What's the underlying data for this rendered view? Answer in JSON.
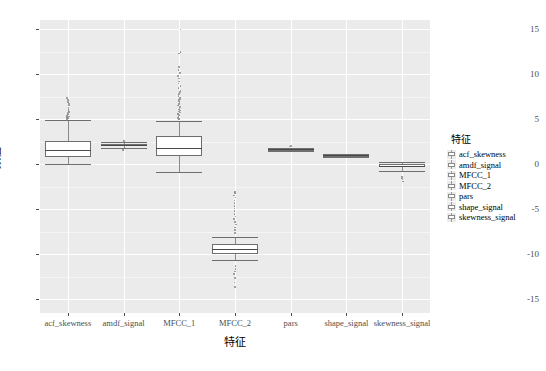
{
  "chart_data": {
    "type": "box",
    "title": "",
    "xlabel": "特征",
    "ylabel": "数值",
    "ylim": [
      -16.5,
      16.0
    ],
    "yticks": [
      15,
      10,
      5,
      0,
      -5,
      -10,
      -15
    ],
    "ytick_labels": [
      "15",
      "10",
      "5",
      "0",
      "-5",
      "-10",
      "-15"
    ],
    "grid": true,
    "legend_position": "right",
    "legend_title": "特征",
    "categories": [
      "acf_skewness",
      "amdf_signal",
      "MFCC_1",
      "MFCC_2",
      "pars",
      "shape_signal",
      "skewness_signal"
    ],
    "boxes": [
      {
        "name": "acf_skewness",
        "min": 0.05,
        "q1": 0.85,
        "median": 1.55,
        "q3": 2.55,
        "max": 4.95,
        "outliers": [
          5.05,
          5.1,
          5.15,
          5.2,
          5.25,
          5.3,
          5.35,
          5.45,
          5.5,
          5.6,
          5.7,
          5.8,
          5.9,
          6.0,
          6.1,
          6.3,
          6.5,
          6.7,
          6.9,
          7.1,
          7.35
        ]
      },
      {
        "name": "amdf_signal",
        "min": 1.75,
        "q1": 2.0,
        "median": 2.1,
        "q3": 2.2,
        "max": 2.45,
        "outliers": [
          1.6,
          1.55,
          2.6,
          2.65
        ]
      },
      {
        "name": "MFCC_1",
        "min": -0.9,
        "q1": 0.95,
        "median": 1.85,
        "q3": 3.1,
        "max": 4.85,
        "outliers": [
          4.95,
          5.05,
          5.15,
          5.25,
          5.35,
          5.45,
          5.55,
          5.65,
          5.75,
          5.85,
          5.95,
          6.05,
          6.2,
          6.35,
          6.5,
          6.65,
          6.8,
          6.95,
          7.1,
          7.25,
          7.4,
          7.6,
          7.8,
          8.0,
          8.2,
          8.45,
          8.7,
          8.95,
          9.2,
          9.5,
          9.8,
          10.1,
          10.45,
          10.8,
          12.3,
          12.45,
          14.95
        ]
      },
      {
        "name": "MFCC_2",
        "min": -10.6,
        "q1": -10.0,
        "median": -9.45,
        "q3": -8.85,
        "max": -8.1,
        "outliers": [
          -3.05,
          -3.2,
          -3.45,
          -3.7,
          -4.0,
          -4.3,
          -4.6,
          -4.9,
          -5.2,
          -5.5,
          -5.8,
          -6.1,
          -6.4,
          -6.7,
          -7.0,
          -7.3,
          -7.6,
          -11.3,
          -11.6,
          -11.9,
          -12.2,
          -12.6,
          -13.1,
          -13.6
        ]
      },
      {
        "name": "pars",
        "min": 1.5,
        "q1": 1.6,
        "median": 1.65,
        "q3": 1.7,
        "max": 1.8,
        "outliers": [
          1.95,
          2.05
        ]
      },
      {
        "name": "shape_signal",
        "min": 0.85,
        "q1": 0.95,
        "median": 1.0,
        "q3": 1.05,
        "max": 1.15,
        "outliers": []
      },
      {
        "name": "skewness_signal",
        "min": -0.75,
        "q1": -0.35,
        "median": -0.15,
        "q3": 0.0,
        "max": 0.25,
        "outliers": [
          -1.35,
          -1.5,
          -1.7,
          -1.9
        ]
      }
    ]
  },
  "legend": {
    "title": "特征",
    "items": [
      "acf_skewness",
      "amdf_signal",
      "MFCC_1",
      "MFCC_2",
      "pars",
      "shape_signal",
      "skewness_signal"
    ]
  },
  "colors": {
    "panel_background": "#ebebeb",
    "grid_major": "#ffffff",
    "grid_minor": "#f5f5f5",
    "box_fill": "#ffffff",
    "box_stroke": "#6e6e6e",
    "outlier": "#8f8f8f",
    "text": "#000000",
    "axis_text": "#4d4d4d"
  }
}
